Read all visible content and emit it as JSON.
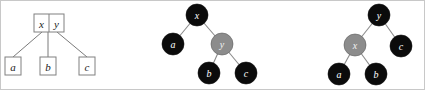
{
  "figure": {
    "caption": "",
    "background_color": "#ffffff",
    "border_color": "#c8c8c8",
    "width": 425,
    "height": 90
  },
  "colors": {
    "node_black_fill": "#0b0b0b",
    "node_gray_fill": "#8c8c8c",
    "edge_stroke": "#8a8a8a",
    "box_stroke": "#808080",
    "box_fill": "#ffffff",
    "label_on_dark": "#ffffff",
    "label_dark": "#1a1a1a"
  },
  "panels": [
    {
      "id": "box-tree",
      "name": "two-key-node-with-three-children",
      "type": "box-diagram",
      "root": {
        "name": "root-box",
        "keys": [
          {
            "label": "x",
            "cell": "left"
          },
          {
            "label": "y",
            "cell": "right"
          }
        ]
      },
      "children": [
        {
          "label": "a",
          "position": "left"
        },
        {
          "label": "b",
          "position": "middle"
        },
        {
          "label": "c",
          "position": "right"
        }
      ],
      "edges": [
        {
          "from": "root-box",
          "to": "a"
        },
        {
          "from": "root-box",
          "to": "b"
        },
        {
          "from": "root-box",
          "to": "c"
        }
      ]
    },
    {
      "id": "tree-middle",
      "name": "binary-tree-x-root",
      "type": "binary-tree",
      "nodes": [
        {
          "id": "m-x",
          "label": "x",
          "color": "black",
          "role": "root"
        },
        {
          "id": "m-a",
          "label": "a",
          "color": "black",
          "role": "left-child"
        },
        {
          "id": "m-y",
          "label": "y",
          "color": "gray",
          "role": "right-child"
        },
        {
          "id": "m-b",
          "label": "b",
          "color": "black",
          "role": "leaf"
        },
        {
          "id": "m-c",
          "label": "c",
          "color": "black",
          "role": "leaf"
        }
      ],
      "edges": [
        {
          "from": "m-x",
          "to": "m-a"
        },
        {
          "from": "m-x",
          "to": "m-y"
        },
        {
          "from": "m-y",
          "to": "m-b"
        },
        {
          "from": "m-y",
          "to": "m-c"
        }
      ]
    },
    {
      "id": "tree-right",
      "name": "binary-tree-y-root",
      "type": "binary-tree",
      "nodes": [
        {
          "id": "r-y",
          "label": "y",
          "color": "black",
          "role": "root"
        },
        {
          "id": "r-x",
          "label": "x",
          "color": "gray",
          "role": "left-child"
        },
        {
          "id": "r-c",
          "label": "c",
          "color": "black",
          "role": "right-child"
        },
        {
          "id": "r-a",
          "label": "a",
          "color": "black",
          "role": "leaf"
        },
        {
          "id": "r-b",
          "label": "b",
          "color": "black",
          "role": "leaf"
        }
      ],
      "edges": [
        {
          "from": "r-y",
          "to": "r-x"
        },
        {
          "from": "r-y",
          "to": "r-c"
        },
        {
          "from": "r-x",
          "to": "r-a"
        },
        {
          "from": "r-x",
          "to": "r-b"
        }
      ]
    }
  ]
}
